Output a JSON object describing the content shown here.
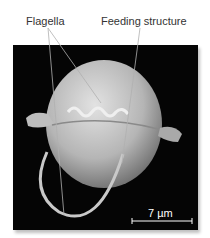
{
  "figure": {
    "labels": {
      "flagella": "Flagella",
      "feeding_structure": "Feeding structure"
    },
    "scale_bar": {
      "label": "7 µm"
    },
    "colors": {
      "background": "#ffffff",
      "image_background": "#050505",
      "cell": "#b8b8b8",
      "leader_line": "#aaaaaa",
      "scale_bar": "#ffffff"
    }
  }
}
